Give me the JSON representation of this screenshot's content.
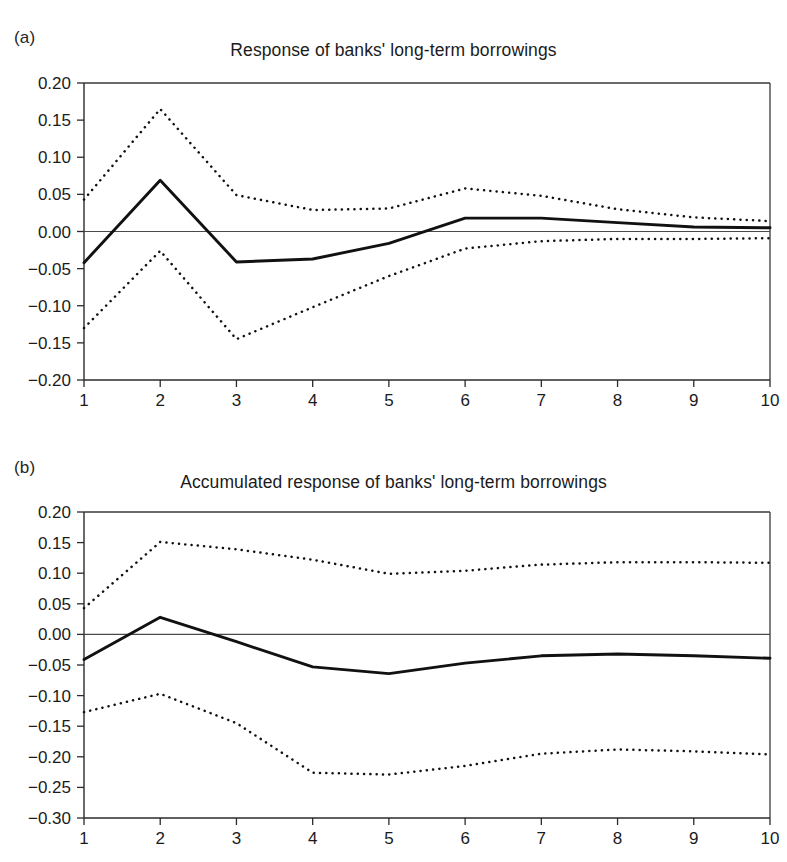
{
  "figure": {
    "panels": [
      {
        "letter": "(a)",
        "title": "Response of banks' long-term borrowings"
      },
      {
        "letter": "(b)",
        "title": "Accumulated response of banks' long-term borrowings"
      }
    ]
  },
  "chart_data": [
    {
      "type": "line",
      "panel": "(a)",
      "title": "Response of banks' long-term borrowings",
      "xlabel": "",
      "ylabel": "",
      "x": [
        1,
        2,
        3,
        4,
        5,
        6,
        7,
        8,
        9,
        10
      ],
      "xticklabels": [
        "1",
        "2",
        "3",
        "4",
        "5",
        "6",
        "7",
        "8",
        "9",
        "10"
      ],
      "yticklabels": [
        "0.20",
        "0.15",
        "0.10",
        "0.05",
        "0.00",
        "-0.05",
        "-0.10",
        "-0.15",
        "-0.20"
      ],
      "ylim": [
        -0.2,
        0.2
      ],
      "xlim": [
        1,
        10
      ],
      "ytick_step": 0.05,
      "grid": false,
      "legend": "none",
      "zero_line": 0.0,
      "series": [
        {
          "name": "Impulse response",
          "style": "solid",
          "values": [
            -0.042,
            0.069,
            -0.041,
            -0.037,
            -0.016,
            0.018,
            0.018,
            0.012,
            0.006,
            0.005
          ]
        },
        {
          "name": "Upper confidence band",
          "style": "dotted",
          "values": [
            0.043,
            0.165,
            0.049,
            0.029,
            0.031,
            0.058,
            0.048,
            0.03,
            0.019,
            0.014
          ]
        },
        {
          "name": "Lower confidence band",
          "style": "dotted",
          "values": [
            -0.13,
            -0.026,
            -0.145,
            -0.102,
            -0.06,
            -0.023,
            -0.013,
            -0.01,
            -0.01,
            -0.009
          ]
        }
      ]
    },
    {
      "type": "line",
      "panel": "(b)",
      "title": "Accumulated response of banks' long-term borrowings",
      "xlabel": "",
      "ylabel": "",
      "x": [
        1,
        2,
        3,
        4,
        5,
        6,
        7,
        8,
        9,
        10
      ],
      "xticklabels": [
        "1",
        "2",
        "3",
        "4",
        "5",
        "6",
        "7",
        "8",
        "9",
        "10"
      ],
      "yticklabels": [
        "0.20",
        "0.15",
        "0.10",
        "0.05",
        "0.00",
        "-0.05",
        "-0.10",
        "-0.15",
        "-0.20",
        "-0.25",
        "-0.30"
      ],
      "ylim": [
        -0.3,
        0.2
      ],
      "xlim": [
        1,
        10
      ],
      "ytick_step": 0.05,
      "grid": false,
      "legend": "none",
      "zero_line": 0.0,
      "series": [
        {
          "name": "Accumulated impulse response",
          "style": "solid",
          "values": [
            -0.041,
            0.028,
            -0.012,
            -0.053,
            -0.064,
            -0.047,
            -0.035,
            -0.032,
            -0.035,
            -0.039
          ]
        },
        {
          "name": "Upper confidence band",
          "style": "dotted",
          "values": [
            0.043,
            0.151,
            0.139,
            0.122,
            0.099,
            0.104,
            0.114,
            0.118,
            0.118,
            0.117
          ]
        },
        {
          "name": "Lower confidence band",
          "style": "dotted",
          "values": [
            -0.127,
            -0.097,
            -0.145,
            -0.226,
            -0.229,
            -0.215,
            -0.195,
            -0.188,
            -0.191,
            -0.196
          ]
        }
      ]
    }
  ]
}
